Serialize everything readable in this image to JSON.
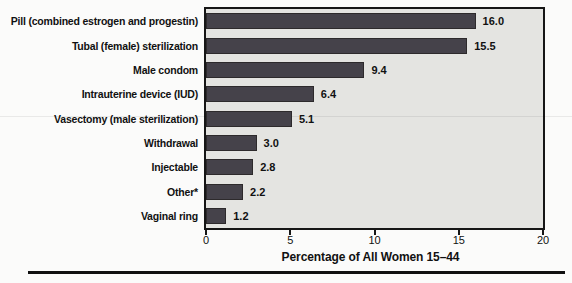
{
  "chart_data": {
    "type": "bar",
    "orientation": "horizontal",
    "title": "",
    "categories": [
      "Pill (combined estrogen and progestin)",
      "Tubal (female) sterilization",
      "Male condom",
      "Intrauterine device (IUD)",
      "Vasectomy (male sterilization)",
      "Withdrawal",
      "Injectable",
      "Other*",
      "Vaginal ring"
    ],
    "values": [
      16.0,
      15.5,
      9.4,
      6.4,
      5.1,
      3.0,
      2.8,
      2.2,
      1.2
    ],
    "value_labels": [
      "16.0",
      "15.5",
      "9.4",
      "6.4",
      "5.1",
      "3.0",
      "2.8",
      "2.2",
      "1.2"
    ],
    "xlabel": "Percentage of All Women 15–44",
    "ylabel": "",
    "x_ticks": [
      0,
      5,
      10,
      15,
      20
    ],
    "xlim": [
      0,
      20
    ],
    "grid": false,
    "legend": false,
    "bar_color": "#45424a",
    "bar_edge_color": "#2d2a2c",
    "plot_bg": "#e4e4e1",
    "border_color": "#161616",
    "text_color": "#111111"
  }
}
